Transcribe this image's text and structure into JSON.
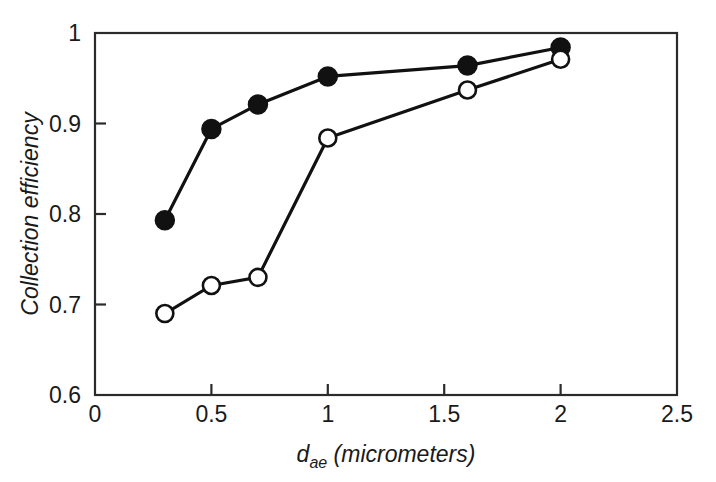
{
  "chart_data": {
    "type": "line",
    "title": "",
    "subtitle": "",
    "xlabel_main": "d",
    "xlabel_sub": "ae",
    "xlabel_rest": " (micrometers)",
    "xlabel": "d_ae (micrometers)",
    "ylabel": "Collection efficiency",
    "xlim": [
      0,
      2.5
    ],
    "ylim": [
      0.6,
      1.0
    ],
    "xticks": [
      0,
      0.5,
      1,
      1.5,
      2,
      2.5
    ],
    "xtick_labels": [
      "0",
      "0.5",
      "1",
      "1.5",
      "2",
      "2.5"
    ],
    "yticks": [
      0.6,
      0.7,
      0.8,
      0.9,
      1.0
    ],
    "ytick_labels": [
      "0.6",
      "0.7",
      "0.8",
      "0.9",
      "1"
    ],
    "grid": false,
    "legend": "none",
    "frame": "box",
    "line_color": "#111111",
    "series": [
      {
        "name": "filled-circles",
        "marker": "filled-circle",
        "marker_fill": "#111111",
        "marker_stroke": "#111111",
        "x": [
          0.3,
          0.5,
          0.7,
          1.0,
          1.6,
          2.0
        ],
        "values": [
          0.793,
          0.894,
          0.921,
          0.952,
          0.964,
          0.984
        ]
      },
      {
        "name": "open-circles",
        "marker": "open-circle",
        "marker_fill": "#ffffff",
        "marker_stroke": "#111111",
        "x": [
          0.3,
          0.5,
          0.7,
          1.0,
          1.6,
          2.0
        ],
        "values": [
          0.69,
          0.721,
          0.73,
          0.884,
          0.937,
          0.971
        ]
      }
    ],
    "annotations": []
  }
}
